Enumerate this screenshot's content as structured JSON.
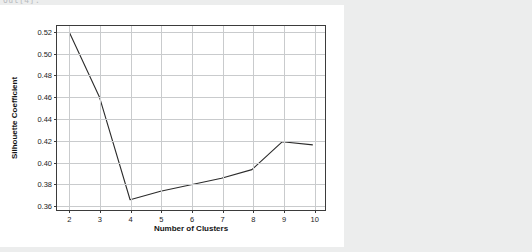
{
  "prompt": {
    "label": "Out[4]:"
  },
  "figure": {
    "background_color": "#ffffff",
    "page_background_color": "#eceded",
    "axis_color": "#3b3b3b",
    "grid_color": "#c9cbcd",
    "line_color": "#2b2b2b"
  },
  "chart_data": {
    "type": "line",
    "title": "",
    "xlabel": "Number of Clusters",
    "ylabel": "Silhouette Coefficient",
    "x": [
      2,
      3,
      4,
      5,
      6,
      7,
      8,
      9,
      10
    ],
    "values": [
      0.52,
      0.459,
      0.364,
      0.372,
      0.378,
      0.384,
      0.392,
      0.418,
      0.415
    ],
    "xlim": [
      1.6,
      10.4
    ],
    "ylim": [
      0.3545,
      0.5255
    ],
    "xticks": [
      2,
      3,
      4,
      5,
      6,
      7,
      8,
      9,
      10
    ],
    "xtick_labels": [
      "2",
      "3",
      "4",
      "5",
      "6",
      "7",
      "8",
      "9",
      "10"
    ],
    "yticks": [
      0.36,
      0.38,
      0.4,
      0.42,
      0.44,
      0.46,
      0.48,
      0.5,
      0.52
    ],
    "ytick_labels": [
      "0.36",
      "0.38",
      "0.40",
      "0.42",
      "0.44",
      "0.46",
      "0.48",
      "0.50",
      "0.52"
    ],
    "grid": true,
    "legend": null,
    "markers": false,
    "series_name": "Silhouette Coefficient"
  }
}
